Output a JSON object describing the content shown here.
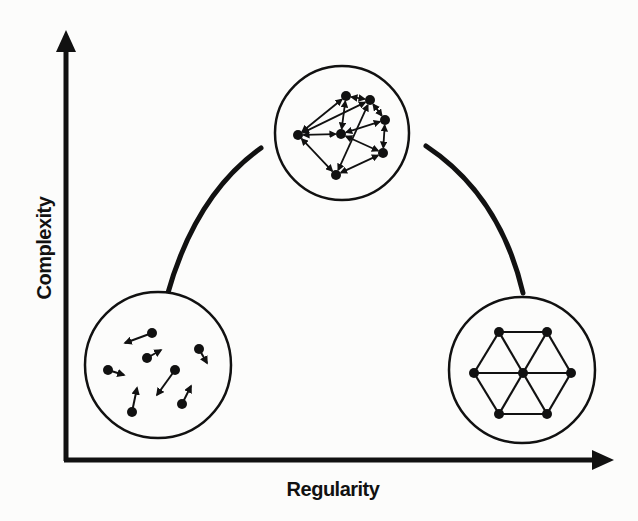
{
  "diagram": {
    "type": "complexity-vs-regularity",
    "axes": {
      "x_label": "Regularity",
      "y_label": "Complexity"
    },
    "colors": {
      "ink": "#111111",
      "background": "#fcfcfb"
    },
    "panels": [
      {
        "id": "random",
        "description": "Disordered particles with random motion vectors (low regularity, low complexity)",
        "center": [
          158,
          365
        ],
        "radius": 73,
        "particles": [
          {
            "from": [
              152,
              333
            ],
            "to": [
              125,
              343
            ]
          },
          {
            "from": [
              147,
              358
            ],
            "to": [
              161,
              350
            ]
          },
          {
            "from": [
              199,
              349
            ],
            "to": [
              207,
              363
            ]
          },
          {
            "from": [
              108,
              370
            ],
            "to": [
              124,
              375
            ]
          },
          {
            "from": [
              175,
              370
            ],
            "to": [
              157,
              395
            ]
          },
          {
            "from": [
              132,
              412
            ],
            "to": [
              137,
              388
            ]
          },
          {
            "from": [
              182,
              404
            ],
            "to": [
              191,
              386
            ]
          }
        ]
      },
      {
        "id": "complex-network",
        "description": "Directed network with heterogeneous connections (high complexity)",
        "center": [
          342,
          133
        ],
        "radius": 67,
        "nodes": [
          [
            298,
            135
          ],
          [
            346,
            96
          ],
          [
            370,
            100
          ],
          [
            385,
            120
          ],
          [
            341,
            134
          ],
          [
            383,
            153
          ],
          [
            336,
            175
          ]
        ],
        "edges": [
          [
            0,
            1
          ],
          [
            0,
            2
          ],
          [
            0,
            4
          ],
          [
            0,
            6
          ],
          [
            1,
            4
          ],
          [
            1,
            2
          ],
          [
            2,
            3
          ],
          [
            2,
            6
          ],
          [
            4,
            3
          ],
          [
            4,
            5
          ],
          [
            3,
            5
          ],
          [
            6,
            5
          ]
        ]
      },
      {
        "id": "lattice",
        "description": "Regular hexagonal lattice (high regularity, low complexity)",
        "center": [
          522,
          370
        ],
        "radius": 73,
        "nodes": [
          [
            499,
            332
          ],
          [
            547,
            332
          ],
          [
            474,
            373
          ],
          [
            523,
            373
          ],
          [
            571,
            373
          ],
          [
            499,
            414
          ],
          [
            547,
            414
          ]
        ],
        "edges": [
          [
            0,
            1
          ],
          [
            1,
            4
          ],
          [
            4,
            6
          ],
          [
            6,
            5
          ],
          [
            5,
            2
          ],
          [
            2,
            0
          ],
          [
            0,
            3
          ],
          [
            1,
            3
          ],
          [
            2,
            3
          ],
          [
            4,
            3
          ],
          [
            5,
            3
          ],
          [
            6,
            3
          ]
        ]
      }
    ],
    "arcs": [
      {
        "id": "arc-left",
        "from": [
          167,
          296
        ],
        "to": [
          261,
          148
        ]
      },
      {
        "id": "arc-right",
        "from": [
          426,
          146
        ],
        "to": [
          523,
          293
        ]
      }
    ]
  }
}
